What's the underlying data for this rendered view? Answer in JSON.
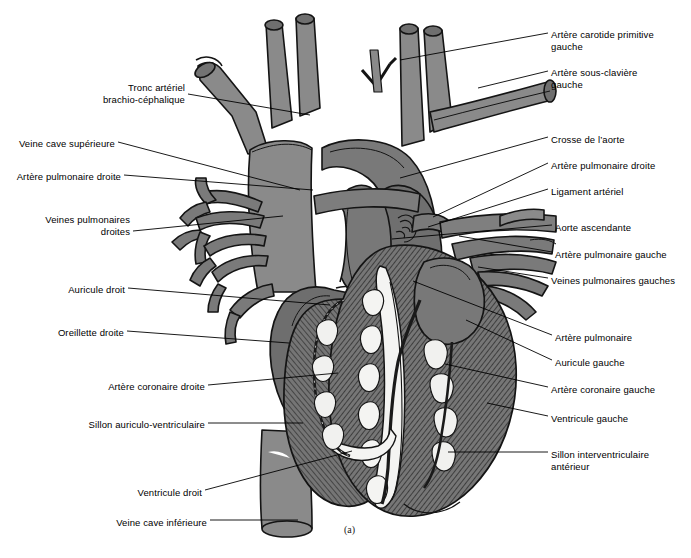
{
  "figure": {
    "caption": "(a)",
    "background_color": "#ffffff",
    "colors": {
      "vessel_gray": "#8a8a8a",
      "atrium_gray": "#6e6e6e",
      "ventricle_gray": "#6f6f6f",
      "fat_white": "#f2f2f0",
      "outline": "#141414",
      "text": "#000000"
    }
  },
  "labels_left": [
    {
      "id": "tronc-arteriel-brachio-cephalique",
      "lines": [
        "Tronc artériel",
        "brachio-céphalique"
      ],
      "text_x": 52,
      "text_y": 82,
      "anchor_x": 188,
      "anchor_y": 94,
      "target_x": 310,
      "target_y": 115
    },
    {
      "id": "veine-cave-superieure",
      "lines": [
        "Veine cave supérieure"
      ],
      "text_x": 23,
      "text_y": 138,
      "anchor_x": 118,
      "anchor_y": 142,
      "target_x": 300,
      "target_y": 190
    },
    {
      "id": "artere-pulmonaire-droite",
      "lines": [
        "Artère pulmonaire droite"
      ],
      "text_x": 12,
      "text_y": 171,
      "anchor_x": 124,
      "anchor_y": 175,
      "target_x": 313,
      "target_y": 190
    },
    {
      "id": "veines-pulmonaires-droites",
      "lines": [
        "Veines pulmonaires",
        "droites"
      ],
      "text_x": 34,
      "text_y": 214,
      "anchor_x": 133,
      "anchor_y": 231,
      "target_x": 283,
      "target_y": 216
    },
    {
      "id": "auricule-droit",
      "lines": [
        "Auricule droit"
      ],
      "text_x": 58,
      "text_y": 284,
      "anchor_x": 128,
      "anchor_y": 288,
      "target_x": 330,
      "target_y": 305
    },
    {
      "id": "oreillette-droite",
      "lines": [
        "Oreillette droite"
      ],
      "text_x": 47,
      "text_y": 327,
      "anchor_x": 127,
      "anchor_y": 331,
      "target_x": 289,
      "target_y": 343
    },
    {
      "id": "artere-coronaire-droite",
      "lines": [
        "Artère coronaire droite"
      ],
      "text_x": 98,
      "text_y": 381,
      "anchor_x": 208,
      "anchor_y": 385,
      "target_x": 338,
      "target_y": 373
    },
    {
      "id": "sillon-auriculo-ventriculaire",
      "lines": [
        "Sillon auriculo-ventriculaire"
      ],
      "text_x": 82,
      "text_y": 419,
      "anchor_x": 208,
      "anchor_y": 423,
      "target_x": 303,
      "target_y": 423
    },
    {
      "id": "ventricule-droit",
      "lines": [
        "Ventricule droit"
      ],
      "text_x": 133,
      "text_y": 487,
      "anchor_x": 205,
      "anchor_y": 490,
      "target_x": 352,
      "target_y": 451
    },
    {
      "id": "veine-cave-inferieure",
      "lines": [
        "Veine cave inférieure"
      ],
      "text_x": 110,
      "text_y": 517,
      "anchor_x": 210,
      "anchor_y": 520,
      "target_x": 298,
      "target_y": 520
    }
  ],
  "labels_right": [
    {
      "id": "artere-carotide-primitive-gauche",
      "lines": [
        "Artère carotide primitive",
        "gauche"
      ],
      "text_x": 551,
      "text_y": 29,
      "anchor_x": 548,
      "anchor_y": 33,
      "target_x": 400,
      "target_y": 60
    },
    {
      "id": "artere-sous-claviere-gauche",
      "lines": [
        "Artère sous-clavière",
        "gauche"
      ],
      "text_x": 551,
      "text_y": 67,
      "anchor_x": 548,
      "anchor_y": 71,
      "target_x": 478,
      "target_y": 88
    },
    {
      "id": "crosse-de-l-aorte",
      "lines": [
        "Crosse de l’aorte"
      ],
      "text_x": 551,
      "text_y": 134,
      "anchor_x": 548,
      "anchor_y": 137,
      "target_x": 400,
      "target_y": 178
    },
    {
      "id": "artere-pulmonaire-droite-right",
      "lines": [
        "Artère pulmonaire droite"
      ],
      "text_x": 551,
      "text_y": 160,
      "anchor_x": 548,
      "anchor_y": 163,
      "target_x": 433,
      "target_y": 217
    },
    {
      "id": "ligament-arteriel",
      "lines": [
        "Ligament artériel"
      ],
      "text_x": 551,
      "text_y": 186,
      "anchor_x": 548,
      "anchor_y": 189,
      "target_x": 428,
      "target_y": 227
    },
    {
      "id": "aorte-ascendante",
      "lines": [
        "Aorte ascendante"
      ],
      "text_x": 555,
      "text_y": 222,
      "anchor_x": 552,
      "anchor_y": 225,
      "target_x": 392,
      "target_y": 239
    },
    {
      "id": "artere-pulmonaire-gauche",
      "lines": [
        "Artère pulmonaire gauche"
      ],
      "text_x": 555,
      "text_y": 249,
      "anchor_x": 552,
      "anchor_y": 252,
      "target_x": 459,
      "target_y": 236
    },
    {
      "id": "veines-pulmonaires-gauches",
      "lines": [
        "Veines pulmonaires gauches"
      ],
      "text_x": 551,
      "text_y": 275,
      "anchor_x": 548,
      "anchor_y": 278,
      "target_x": 478,
      "target_y": 267
    },
    {
      "id": "artere-pulmonaire",
      "lines": [
        "Artère pulmonaire"
      ],
      "text_x": 555,
      "text_y": 332,
      "anchor_x": 552,
      "anchor_y": 335,
      "target_x": 413,
      "target_y": 281
    },
    {
      "id": "auricule-gauche",
      "lines": [
        "Auricule gauche"
      ],
      "text_x": 555,
      "text_y": 357,
      "anchor_x": 552,
      "anchor_y": 360,
      "target_x": 466,
      "target_y": 320
    },
    {
      "id": "artere-coronaire-gauche",
      "lines": [
        "Artère coronaire gauche"
      ],
      "text_x": 551,
      "text_y": 384,
      "anchor_x": 548,
      "anchor_y": 387,
      "target_x": 445,
      "target_y": 364
    },
    {
      "id": "ventricule-gauche",
      "lines": [
        "Ventricule gauche"
      ],
      "text_x": 551,
      "text_y": 413,
      "anchor_x": 548,
      "anchor_y": 416,
      "target_x": 487,
      "target_y": 403
    },
    {
      "id": "sillon-interventriculaire-anterieur",
      "lines": [
        "Sillon interventriculaire",
        "antérieur"
      ],
      "text_x": 551,
      "text_y": 449,
      "anchor_x": 548,
      "anchor_y": 452,
      "target_x": 448,
      "target_y": 452
    }
  ]
}
